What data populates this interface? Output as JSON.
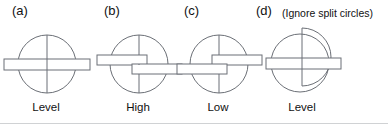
{
  "figure": {
    "background_color": "#ffffff",
    "stroke_color": "#6b6f76",
    "text_color": "#111111",
    "divider_color": "#d0d2d4",
    "panels": [
      {
        "letter": "(a)",
        "note": "",
        "caption": "Level",
        "type": "level",
        "circle": {
          "cx": 47,
          "cy": 34,
          "r": 29
        },
        "vertical_line": {
          "x": 47,
          "y1": 5,
          "y2": 63
        },
        "bars": [
          {
            "x": 4,
            "y": 29,
            "width": 86,
            "height": 11,
            "name": "level-bar"
          }
        ]
      },
      {
        "letter": "(b)",
        "note": "",
        "caption": "High",
        "type": "high",
        "circle": {
          "cx": 47,
          "cy": 34,
          "r": 29
        },
        "vertical_line": {
          "x": 47,
          "y1": 5,
          "y2": 63
        },
        "bars": [
          {
            "x": 5,
            "y": 25,
            "width": 50,
            "height": 10,
            "name": "left-bar-high"
          },
          {
            "x": 40,
            "y": 34,
            "width": 50,
            "height": 10,
            "name": "right-bar-low"
          }
        ]
      },
      {
        "letter": "(c)",
        "note": "",
        "caption": "Low",
        "type": "low",
        "circle": {
          "cx": 47,
          "cy": 34,
          "r": 29
        },
        "vertical_line": {
          "x": 47,
          "y1": 5,
          "y2": 63
        },
        "bars": [
          {
            "x": 5,
            "y": 34,
            "width": 50,
            "height": 10,
            "name": "left-bar-low"
          },
          {
            "x": 40,
            "y": 25,
            "width": 50,
            "height": 10,
            "name": "right-bar-high"
          }
        ]
      },
      {
        "letter": "(d)",
        "note": "(Ignore split circles)",
        "caption": "Level",
        "type": "split-level",
        "circle": {
          "cx": 42,
          "cy": 37,
          "r": 29
        },
        "split_half": {
          "cx": 44,
          "cy": 31,
          "r": 29
        },
        "vertical_line": {
          "x": 44,
          "y1": 2,
          "y2": 60
        },
        "bars": [
          {
            "x": 8,
            "y": 32,
            "width": 75,
            "height": 11,
            "name": "level-bar"
          }
        ]
      }
    ]
  }
}
